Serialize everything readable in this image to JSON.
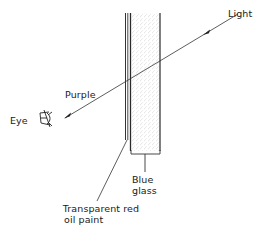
{
  "diagram": {
    "labels": {
      "light": "Light",
      "purple": "Purple",
      "eye": "Eye",
      "blue_glass_line1": "Blue",
      "blue_glass_line2": "glass",
      "red_paint_line1": "Transparent red",
      "red_paint_line2": "oil paint"
    },
    "components": [
      {
        "name": "blue-glass",
        "label": "Blue glass",
        "fill": "stippled"
      },
      {
        "name": "transparent-red-oil-paint",
        "label": "Transparent red oil paint",
        "fill": "thin layer"
      }
    ],
    "ray": {
      "from": "Light",
      "to": "Eye",
      "resulting_color": "Purple"
    },
    "colors": {
      "line": "#333333",
      "stipple": "#9a9a9a",
      "background": "#ffffff"
    },
    "icons": {
      "eye": "eye-icon",
      "arrow": "arrowhead-icon"
    }
  }
}
